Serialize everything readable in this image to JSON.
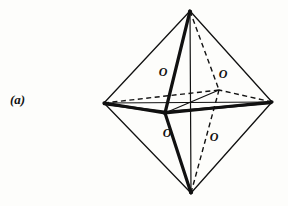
{
  "figure": {
    "panel_label": "(a)",
    "stroke_color": "#111111",
    "background_color": "#fdfdfb",
    "thin_stroke_width": 1.3,
    "bold_stroke_width": 3.2,
    "dash_stroke_width": 1.4,
    "dash_pattern": "5,3.5"
  },
  "vertices": {
    "top": {
      "name": "top-apex",
      "x": 190,
      "y": 11
    },
    "bottom": {
      "name": "bottom-apex",
      "x": 191,
      "y": 193
    },
    "left": {
      "name": "left-vertex",
      "x": 104,
      "y": 103
    },
    "right": {
      "name": "right-vertex",
      "x": 272,
      "y": 102
    },
    "front": {
      "name": "front-vertex",
      "x": 165,
      "y": 113
    },
    "back": {
      "name": "back-vertex",
      "x": 219,
      "y": 90
    }
  },
  "atom_labels": [
    {
      "id": "o-upper-left",
      "text": "O",
      "x": 156,
      "y": 66
    },
    {
      "id": "o-upper-right",
      "text": "O",
      "x": 216,
      "y": 68
    },
    {
      "id": "o-lower-left",
      "text": "O",
      "x": 160,
      "y": 127
    },
    {
      "id": "o-lower-right",
      "text": "O",
      "x": 207,
      "y": 131
    }
  ]
}
